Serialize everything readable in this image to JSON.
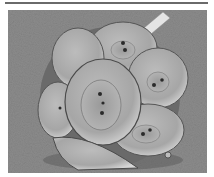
{
  "image": {
    "description": "Scanning electron micrograph of a coccolithophore (coccosphere) covered with overlapping oval coccolith plates on a grainy gray background",
    "subject": "coccosphere",
    "colors": {
      "background": "#8a8a8a",
      "sphere_light": "#c8c8c8",
      "sphere_mid": "#a8a8a8",
      "shadow": "#3a3a3a",
      "border_line": "#6a6a6a"
    }
  }
}
